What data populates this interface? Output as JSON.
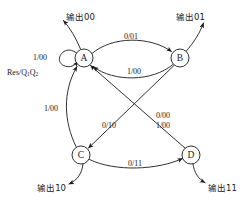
{
  "diagram": {
    "type": "mealy-state-transition-diagram",
    "states": [
      {
        "id": "A",
        "label": "A",
        "cx": 84,
        "cy": 58,
        "r": 9
      },
      {
        "id": "B",
        "label": "B",
        "cx": 180,
        "cy": 58,
        "r": 9
      },
      {
        "id": "C",
        "label": "C",
        "cx": 81,
        "cy": 155,
        "r": 9
      },
      {
        "id": "D",
        "label": "D",
        "cx": 191,
        "cy": 155,
        "r": 9
      }
    ],
    "transitions": [
      {
        "from": "A",
        "to": "A",
        "label": "1/00",
        "kind": "self-loop"
      },
      {
        "from": "A",
        "to": "B",
        "label": "0/01",
        "kind": "curve-top"
      },
      {
        "from": "B",
        "to": "A",
        "label": "1/00",
        "kind": "curve-bottom"
      },
      {
        "from": "B",
        "to": "C",
        "label": "0/10",
        "kind": "diagonal"
      },
      {
        "from": "C",
        "to": "A",
        "label": "1/00",
        "kind": "curve-left"
      },
      {
        "from": "C",
        "to": "D",
        "label": "0/11",
        "kind": "curve-bottom"
      },
      {
        "from": "D",
        "to": "A",
        "label": "0/00",
        "label2": "1/00",
        "kind": "diagonal"
      }
    ],
    "reset": {
      "text_main": "Res/Q",
      "sub1": "1",
      "text_mid": "Q",
      "sub2": "2",
      "full": "Res/Q1Q2"
    },
    "outputs": [
      {
        "id": "out-a",
        "label": "输出00",
        "state": "A"
      },
      {
        "id": "out-b",
        "label": "输出01",
        "state": "B"
      },
      {
        "id": "out-c",
        "label": "输出10",
        "state": "C"
      },
      {
        "id": "out-d",
        "label": "输出11",
        "state": "D"
      }
    ],
    "colors": {
      "stroke": "#1a1a1a",
      "background": "#ffffff",
      "node_fill": "#ffffff"
    }
  }
}
